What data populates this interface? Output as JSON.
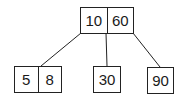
{
  "diagram": {
    "type": "b-tree",
    "root": {
      "keys": [
        "10",
        "60"
      ]
    },
    "children": [
      {
        "keys": [
          "5",
          "8"
        ]
      },
      {
        "keys": [
          "30"
        ]
      },
      {
        "keys": [
          "90"
        ]
      }
    ],
    "edges": [
      {
        "from": "root",
        "to": "child-0"
      },
      {
        "from": "root",
        "to": "child-1"
      },
      {
        "from": "root",
        "to": "child-2"
      }
    ]
  }
}
